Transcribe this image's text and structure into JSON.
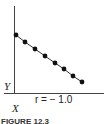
{
  "chart_data": {
    "type": "scatter",
    "title": "",
    "xlabel": "X",
    "ylabel": "Y",
    "annotation": "r = −1.0",
    "x": [
      1,
      2,
      3,
      4,
      5,
      6,
      7,
      8
    ],
    "y": [
      8,
      7,
      6,
      5,
      4,
      3,
      2,
      1
    ],
    "grid": false,
    "legend": null
  },
  "labels": {
    "y_axis": "Y",
    "x_axis": "X",
    "correlation": "r = − 1.0",
    "caption": "FIGURE 12.3"
  },
  "points_px": [
    [
      16,
      35
    ],
    [
      25,
      42
    ],
    [
      35,
      49
    ],
    [
      45,
      56
    ],
    [
      55,
      63
    ],
    [
      64,
      69
    ],
    [
      73,
      76
    ],
    [
      82,
      82
    ]
  ]
}
